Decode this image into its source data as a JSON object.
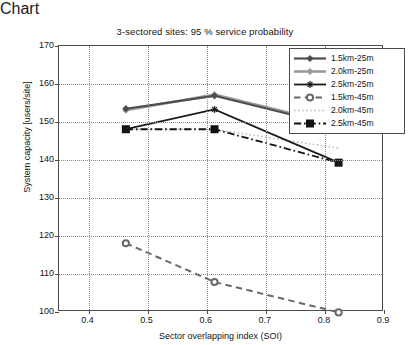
{
  "chart_data": {
    "type": "line",
    "title": "3-sectored sites: 95 % service probability",
    "xlabel": "Sector overlapping index (SOI)",
    "ylabel": "System capacity [users/site]",
    "xlim": [
      0.35,
      0.9
    ],
    "ylim": [
      100,
      170
    ],
    "xticks": [
      0.4,
      0.5,
      0.6,
      0.7,
      0.8,
      0.9
    ],
    "xtick_labels": [
      "0.4",
      "0.5",
      "0.6",
      "0.7",
      "0.8",
      "0.9"
    ],
    "yticks": [
      100,
      110,
      120,
      130,
      140,
      150,
      160,
      170
    ],
    "ytick_labels": [
      "100",
      "110",
      "120",
      "130",
      "140",
      "150",
      "160",
      "170"
    ],
    "grid": "dotted",
    "legend_position": "top-right",
    "x": [
      0.365,
      0.515,
      0.725
    ],
    "series": [
      {
        "name": "1.5km-25m",
        "values": [
          160.6,
          164.0,
          156.0
        ],
        "color": "#4d4d4d",
        "linestyle": "solid",
        "marker": "diamond",
        "linewidth": 2.2
      },
      {
        "name": "2.0km-25m",
        "values": [
          160.2,
          164.3,
          156.4
        ],
        "color": "#9a9a9a",
        "linestyle": "solid",
        "marker": "diamond",
        "linewidth": 2.6
      },
      {
        "name": "2.5km-25m",
        "values": [
          155.2,
          160.4,
          146.4
        ],
        "color": "#1a1a1a",
        "linestyle": "solid",
        "marker": "star",
        "linewidth": 1.8
      },
      {
        "name": "1.5km-45m",
        "values": [
          125.2,
          115.0,
          107.0
        ],
        "color": "#696969",
        "linestyle": "dashed",
        "marker": "circle",
        "linewidth": 2.0
      },
      {
        "name": "2.0km-45m",
        "values": [
          155.2,
          155.2,
          150.2
        ],
        "color": "#bdbdbd",
        "linestyle": "dotted",
        "marker": "none",
        "linewidth": 1.6
      },
      {
        "name": "2.5km-45m",
        "values": [
          155.2,
          155.2,
          146.4
        ],
        "color": "#121212",
        "linestyle": "dashdot",
        "marker": "square",
        "linewidth": 1.8
      }
    ]
  },
  "legend": {
    "entries": [
      {
        "label": "1.5km-25m"
      },
      {
        "label": "2.0km-25m"
      },
      {
        "label": "2.5km-25m"
      },
      {
        "label": "1.5km-45m"
      },
      {
        "label": "2.0km-45m"
      },
      {
        "label": "2.5km-45m"
      }
    ]
  }
}
